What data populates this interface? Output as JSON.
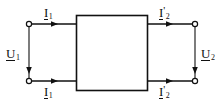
{
  "diagram": {
    "type": "two-port-network",
    "background_color": "#ffffff",
    "line_color": "#111111",
    "box": {
      "name": "two-port-box",
      "x": 76,
      "y": 15,
      "width": 72,
      "height": 76,
      "fill": "#ffffff",
      "stroke": "#111111"
    },
    "terminals": [
      {
        "name": "terminal-top-left",
        "x": 29,
        "y": 24
      },
      {
        "name": "terminal-bottom-left",
        "x": 29,
        "y": 81
      },
      {
        "name": "terminal-top-right",
        "x": 195,
        "y": 24
      },
      {
        "name": "terminal-bottom-right",
        "x": 195,
        "y": 81
      }
    ],
    "labels": {
      "current_top_left": {
        "symbol": "I",
        "subscript": "1",
        "prime": ""
      },
      "current_bottom_left": {
        "symbol": "I",
        "subscript": "1",
        "prime": ""
      },
      "current_top_right": {
        "symbol": "I",
        "subscript": "2",
        "prime": "'"
      },
      "current_bottom_right": {
        "symbol": "I",
        "subscript": "2",
        "prime": "'"
      },
      "voltage_left": {
        "symbol": "U",
        "subscript": "1",
        "prime": ""
      },
      "voltage_right": {
        "symbol": "U",
        "subscript": "2",
        "prime": ""
      }
    },
    "arrows": [
      {
        "name": "arrow-current-top-left",
        "direction": "right",
        "x": 56,
        "y": 24
      },
      {
        "name": "arrow-current-bottom-left",
        "direction": "right",
        "x": 56,
        "y": 81
      },
      {
        "name": "arrow-current-top-right",
        "direction": "right",
        "x": 171,
        "y": 24
      },
      {
        "name": "arrow-current-bottom-right",
        "direction": "right",
        "x": 171,
        "y": 81
      },
      {
        "name": "arrow-voltage-left",
        "direction": "down",
        "x": 29,
        "y": 72
      },
      {
        "name": "arrow-voltage-right",
        "direction": "down",
        "x": 195,
        "y": 72
      }
    ]
  }
}
